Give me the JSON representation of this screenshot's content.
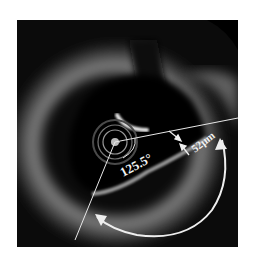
{
  "figure": {
    "type": "OCT cross-section",
    "background_color": "#0a0a0a",
    "annotations": {
      "angle_label": "125.5°",
      "thickness_label": "52μm"
    }
  }
}
